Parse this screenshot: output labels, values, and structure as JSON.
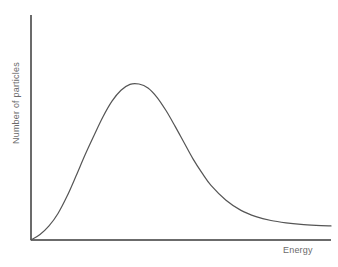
{
  "chart_data": {
    "type": "line",
    "title": "",
    "subtitle": "",
    "xlabel": "Energy",
    "ylabel": "Number of particles",
    "grid": false,
    "legend": null,
    "annotations": [],
    "axis": {
      "x_arrow": false,
      "y_arrow": false,
      "ticks": [],
      "tick_labels": [],
      "xlim": [
        0,
        1
      ],
      "ylim": [
        0,
        1
      ]
    },
    "series": [
      {
        "name": "Maxwell-Boltzmann distribution",
        "color": "#555555",
        "line_width": 1.2,
        "x": [
          0.0,
          0.03,
          0.06,
          0.09,
          0.12,
          0.15,
          0.18,
          0.21,
          0.24,
          0.27,
          0.3,
          0.33,
          0.36,
          0.39,
          0.42,
          0.45,
          0.48,
          0.51,
          0.54,
          0.57,
          0.6,
          0.65,
          0.7,
          0.75,
          0.8,
          0.85,
          0.9,
          0.95,
          1.0
        ],
        "y": [
          0.0,
          0.035,
          0.09,
          0.17,
          0.28,
          0.41,
          0.545,
          0.67,
          0.79,
          0.89,
          0.96,
          0.998,
          1.0,
          0.975,
          0.915,
          0.83,
          0.73,
          0.625,
          0.52,
          0.43,
          0.35,
          0.255,
          0.19,
          0.15,
          0.125,
          0.11,
          0.1,
          0.094,
          0.09
        ]
      }
    ]
  },
  "labels": {
    "y_axis": "Number of particles",
    "x_axis": "Energy"
  },
  "colors": {
    "curve": "#555555",
    "axis": "#6b6b6b",
    "text": "#6b6b6b",
    "background": "#ffffff"
  }
}
